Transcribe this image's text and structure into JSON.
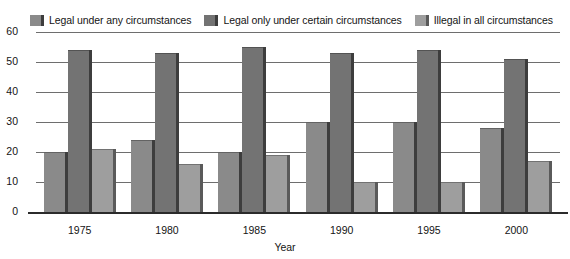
{
  "chart_data": {
    "type": "bar",
    "title": "",
    "subtitle": "",
    "xlabel": "Year",
    "ylabel": "",
    "categories": [
      "1975",
      "1980",
      "1985",
      "1990",
      "1995",
      "2000"
    ],
    "series": [
      {
        "name": "Legal under any circumstances",
        "color": "#8a8a8a",
        "edge_color": "#3d3d3d",
        "values": [
          20,
          24,
          20,
          30,
          30,
          28
        ]
      },
      {
        "name": "Legal only under certain circumstances",
        "color": "#737373",
        "edge_color": "#3d3d3d",
        "values": [
          54,
          53,
          55,
          53,
          54,
          51
        ]
      },
      {
        "name": "Illegal in all circumstances",
        "color": "#9e9e9e",
        "edge_color": "#5a5a5a",
        "values": [
          21,
          16,
          19,
          10,
          10,
          17
        ]
      }
    ],
    "ylim": [
      0,
      60
    ],
    "yticks": [
      "0",
      "10",
      "20",
      "30",
      "40",
      "50",
      "60"
    ],
    "ytick_values": [
      0,
      10,
      20,
      30,
      40,
      50,
      60
    ],
    "grid": true,
    "legend_position": "top"
  },
  "legend": {
    "entries": [
      {
        "label": "Legal under any circumstances"
      },
      {
        "label": "Legal only under certain circumstances"
      },
      {
        "label": "Illegal in all circumstances"
      }
    ]
  },
  "axes": {
    "x_title": "Year"
  }
}
